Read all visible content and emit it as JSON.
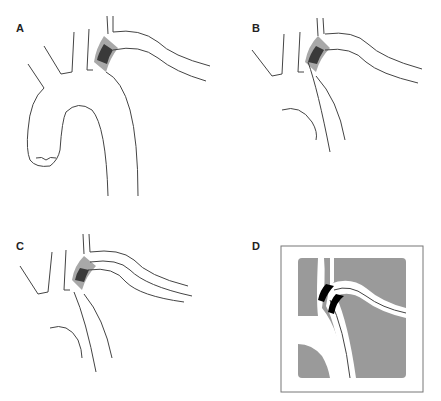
{
  "figure": {
    "panels": [
      {
        "label": "A",
        "description": "Full aortic arch with stent graft at isthmus/left subclavian region"
      },
      {
        "label": "B",
        "description": "Partial arch with stent graft"
      },
      {
        "label": "C",
        "description": "Partial arch with stent graft covering proximal subclavian"
      },
      {
        "label": "D",
        "description": "Magnified view of stent graft region, shaded background"
      }
    ]
  },
  "colors": {
    "line": "#444444",
    "graft_light": "#a8a8a8",
    "graft_dark": "#3a3a3a",
    "graft_black": "#000000",
    "panel_d_bg": "#9a9a9a",
    "background": "#ffffff"
  }
}
